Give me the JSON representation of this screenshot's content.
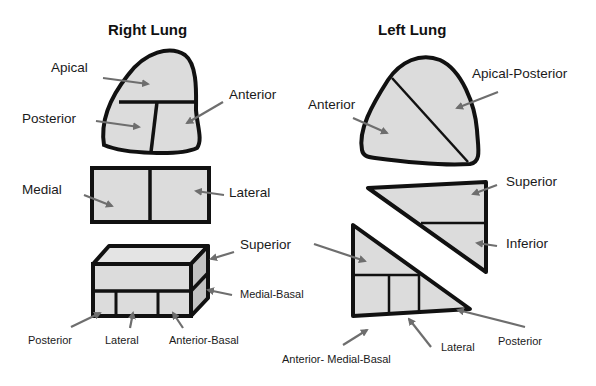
{
  "titles": {
    "right": "Right Lung",
    "left": "Left Lung"
  },
  "colors": {
    "fill": "#dcdcdc",
    "outline": "#111111",
    "arrow": "#6e6e6e"
  },
  "right_lung": {
    "upper_lobe": {
      "apical": "Apical",
      "posterior": "Posterior",
      "anterior": "Anterior"
    },
    "middle_lobe": {
      "medial": "Medial",
      "lateral": "Lateral"
    },
    "lower_lobe": {
      "superior": "Superior",
      "medial_basal": "Medial-Basal",
      "posterior": "Posterior",
      "lateral": "Lateral",
      "anterior_basal": "Anterior-Basal"
    }
  },
  "left_lung": {
    "upper_lobe": {
      "anterior": "Anterior",
      "apical_posterior": "Apical-Posterior"
    },
    "lingula": {
      "superior": "Superior",
      "inferior": "Inferior"
    },
    "lower_lobe": {
      "superior": "Superior",
      "anterior_medial_basal": "Anterior- Medial-Basal",
      "lateral": "Lateral",
      "posterior": "Posterior"
    }
  }
}
